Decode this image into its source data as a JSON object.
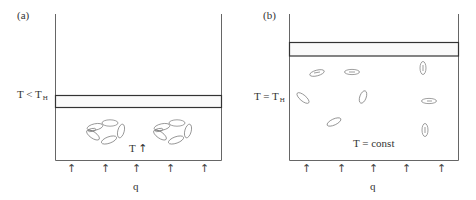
{
  "figure": {
    "colors": {
      "stroke": "#555555",
      "slab_stroke": "#333333",
      "slab_fill": "#fafafa",
      "ellipse_stroke": "#666666",
      "text": "#333333"
    },
    "panel_a": {
      "label": "(a)",
      "condition_label": "T < T",
      "condition_sub": "H",
      "temperature_note": "T",
      "temperature_arrow": "↑",
      "heat_label": "q",
      "heat_arrows": [
        "↑",
        "↑",
        "↑",
        "↑",
        "↑"
      ],
      "clusters": 2,
      "description": "Particles aggregated into ring-like clusters below slab; heat flux q from bottom; temperature rising"
    },
    "panel_b": {
      "label": "(b)",
      "condition_label": "T = T",
      "condition_sub": "H",
      "temperature_note": "T = const",
      "heat_label": "q",
      "heat_arrows": [
        "↑",
        "↑",
        "↑",
        "↑",
        "↑"
      ],
      "dispersed_particles": 8,
      "description": "Particles dispersed individually; slab raised; temperature constant"
    }
  }
}
